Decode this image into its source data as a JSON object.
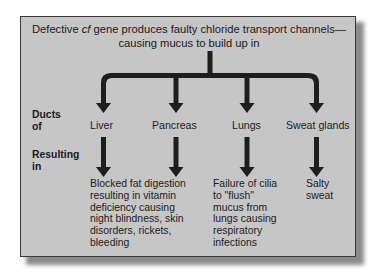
{
  "title": {
    "pre": "Defective ",
    "italic": "cf",
    "post": " gene produces faulty chloride transport channels—",
    "line2": "causing mucus to build up in"
  },
  "row_labels": {
    "ducts_line1": "Ducts",
    "ducts_line2": "of",
    "resulting_line1": "Resulting",
    "resulting_line2": "in"
  },
  "organs": [
    {
      "name": "Liver",
      "result": [
        "Blocked fat digestion",
        "resulting in vitamin",
        "deficiency causing",
        "night blindness, skin",
        "disorders, rickets,",
        "bleeding"
      ]
    },
    {
      "name": "Pancreas",
      "result": []
    },
    {
      "name": "Lungs",
      "result": [
        "Failure of cilia",
        "to \"flush\"",
        "mucus from",
        "lungs causing",
        "respiratory",
        "infections"
      ]
    },
    {
      "name": "Sweat glands",
      "result": [
        "Salty",
        "sweat"
      ]
    }
  ],
  "colors": {
    "panel_bg": "#c6c6c6",
    "arrow": "#1e1e1e",
    "text": "#1c1c1c"
  }
}
